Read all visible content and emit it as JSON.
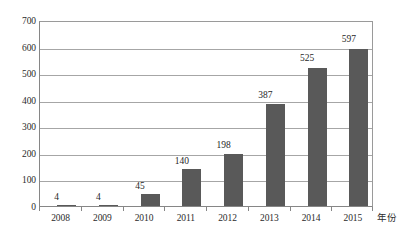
{
  "chart_data": {
    "type": "bar",
    "title": "",
    "xlabel": "年份",
    "ylabel": "",
    "categories": [
      "2008",
      "2009",
      "2010",
      "2011",
      "2012",
      "2013",
      "2014",
      "2015"
    ],
    "values": [
      4,
      4,
      45,
      140,
      198,
      387,
      525,
      597
    ],
    "value_labels": [
      "4",
      "4",
      "45",
      "140",
      "198",
      "387",
      "525",
      "597"
    ],
    "ylim": [
      0,
      700
    ],
    "y_ticks": [
      "0",
      "100",
      "200",
      "300",
      "400",
      "500",
      "600",
      "700"
    ],
    "y_tick_values": [
      0,
      100,
      200,
      300,
      400,
      500,
      600,
      700
    ],
    "grid": true,
    "legend": null,
    "series": [
      {
        "name": "",
        "values": [
          4,
          4,
          45,
          140,
          198,
          387,
          525,
          597
        ]
      }
    ],
    "colors": {
      "bar": "#595959",
      "gridline": "#a6a6a6",
      "axis": "#868686",
      "text": "#2b2b2b",
      "background": "#ffffff"
    }
  }
}
